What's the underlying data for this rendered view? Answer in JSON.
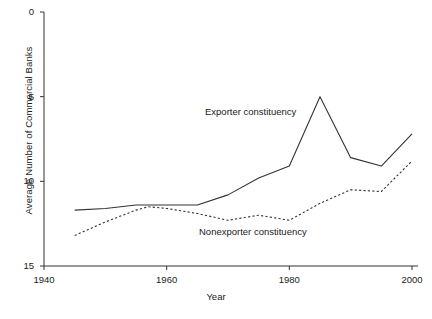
{
  "chart_data": {
    "type": "line",
    "title": "",
    "xlabel": "Year",
    "ylabel": "Average Number of Commercial Banks",
    "xlim": [
      1940,
      2000
    ],
    "ylim": [
      0,
      15
    ],
    "xticks": [
      1940,
      1960,
      1980,
      2000
    ],
    "yticks": [
      0,
      5,
      10,
      15
    ],
    "grid": false,
    "legend_position": "inline-annotations",
    "series": [
      {
        "name": "Exporter constituency",
        "style": "solid",
        "color": "#333333",
        "x": [
          1945,
          1950,
          1955,
          1957,
          1960,
          1965,
          1970,
          1975,
          1980,
          1985,
          1990,
          1995,
          2000
        ],
        "values": [
          3.3,
          3.4,
          3.6,
          3.6,
          3.6,
          3.6,
          4.2,
          5.2,
          5.9,
          10.0,
          6.4,
          5.9,
          7.8
        ]
      },
      {
        "name": "Nonexporter constituency",
        "style": "dotted",
        "color": "#333333",
        "x": [
          1945,
          1950,
          1955,
          1957,
          1960,
          1965,
          1970,
          1975,
          1980,
          1985,
          1990,
          1995,
          2000
        ],
        "values": [
          1.8,
          2.6,
          3.3,
          3.5,
          3.4,
          3.1,
          2.7,
          3.0,
          2.7,
          3.7,
          4.5,
          4.4,
          6.2
        ]
      }
    ]
  },
  "axes": {
    "ylabel": "Average Number of Commercial Banks",
    "xlabel": "Year",
    "yticks": [
      {
        "label": "15"
      },
      {
        "label": "10"
      },
      {
        "label": "5"
      },
      {
        "label": "0"
      }
    ],
    "xticks": [
      {
        "label": "1940"
      },
      {
        "label": "1960"
      },
      {
        "label": "1980"
      },
      {
        "label": "2000"
      }
    ]
  },
  "annotations": {
    "exporter": "Exporter constituency",
    "nonexporter": "Nonexporter constituency"
  }
}
